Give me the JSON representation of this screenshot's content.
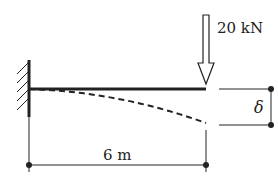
{
  "diagram": {
    "type": "cantilever-beam-deflection",
    "load": {
      "label": "20 kN",
      "direction": "down"
    },
    "span": {
      "label": "6 m"
    },
    "deflection": {
      "label": "δ"
    },
    "support": "fixed-wall",
    "colors": {
      "stroke": "#222222",
      "background": "#ffffff"
    }
  }
}
